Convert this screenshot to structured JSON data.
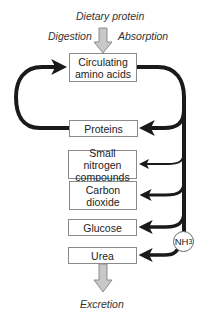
{
  "labels": {
    "top_input": "Dietary protein",
    "left_process": "Digestion",
    "right_process": "Absorption",
    "bottom_output": "Excretion"
  },
  "boxes": [
    {
      "id": "circulating",
      "line1": "Circulating",
      "line2": "amino acids"
    },
    {
      "id": "proteins",
      "line1": "Proteins"
    },
    {
      "id": "small-nitrogen",
      "line1": "Small nitrogen",
      "line2": "compounds"
    },
    {
      "id": "carbon-dioxide",
      "line1": "Carbon",
      "line2": "dioxide"
    },
    {
      "id": "glucose",
      "line1": "Glucose"
    },
    {
      "id": "urea",
      "line1": "Urea"
    }
  ],
  "ammonia": {
    "base": "NH",
    "subscript": "3"
  },
  "colors": {
    "arrow": "#1a1a1a",
    "input_arrow_fill": "#c8c8c8",
    "box_border": "#8a8a8a"
  }
}
